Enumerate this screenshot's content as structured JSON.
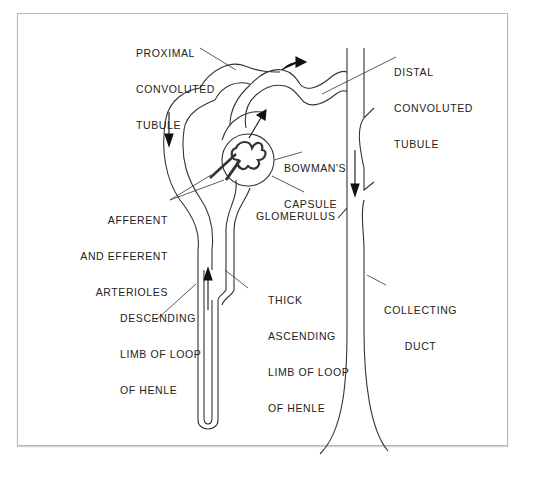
{
  "figure": {
    "colors": {
      "line": "#333333",
      "frame": "#b8b8b8",
      "background": "#ffffff"
    }
  },
  "labels": {
    "proximal": {
      "lines": [
        "PROXIMAL",
        "CONVOLUTED",
        "TUBULE"
      ]
    },
    "distal": {
      "lines": [
        "DISTAL",
        "CONVOLUTED",
        "TUBULE"
      ]
    },
    "bowmans": {
      "lines": [
        "BOWMAN'S",
        "CAPSULE"
      ]
    },
    "glomerulus": {
      "lines": [
        "GLOMERULUS"
      ]
    },
    "arterioles": {
      "lines": [
        "AFFERENT",
        "AND EFFERENT",
        "ARTERIOLES"
      ]
    },
    "descending": {
      "lines": [
        "DESCENDING",
        "LIMB OF LOOP",
        "OF HENLE"
      ]
    },
    "ascending": {
      "lines": [
        "THICK",
        "ASCENDING",
        "LIMB OF LOOP",
        "OF HENLE"
      ]
    },
    "collecting": {
      "lines": [
        "COLLECTING",
        "DUCT"
      ]
    }
  },
  "arrows": [
    {
      "name": "proximal-flow-arrow",
      "direction": "down"
    },
    {
      "name": "distal-flow-arrow",
      "direction": "right"
    },
    {
      "name": "capsule-outflow-arrow",
      "direction": "up-right"
    },
    {
      "name": "ascending-limb-arrow",
      "direction": "up"
    },
    {
      "name": "collecting-duct-arrow",
      "direction": "down"
    }
  ]
}
